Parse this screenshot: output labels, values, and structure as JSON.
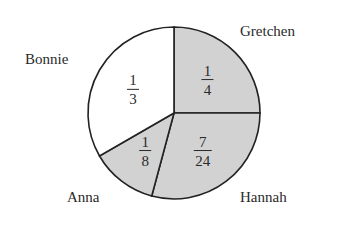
{
  "chart_data": {
    "type": "pie",
    "title": "",
    "slices": [
      {
        "label": "Gretchen",
        "fraction": "1/4",
        "num": "1",
        "den": "4",
        "value": 0.25,
        "fill": "#d2d2d2"
      },
      {
        "label": "Hannah",
        "fraction": "7/24",
        "num": "7",
        "den": "24",
        "value": 0.2917,
        "fill": "#d2d2d2"
      },
      {
        "label": "Anna",
        "fraction": "1/8",
        "num": "1",
        "den": "8",
        "value": 0.125,
        "fill": "#d2d2d2"
      },
      {
        "label": "Bonnie",
        "fraction": "1/3",
        "num": "1",
        "den": "3",
        "value": 0.3333,
        "fill": "#ffffff"
      }
    ],
    "start_angle_deg": 0,
    "direction": "clockwise from 12 o'clock",
    "legend": "none; labels placed outside slices"
  },
  "labels": {
    "gretchen": "Gretchen",
    "hannah": "Hannah",
    "anna": "Anna",
    "bonnie": "Bonnie"
  },
  "colors": {
    "shaded": "#d2d2d2",
    "unshaded": "#ffffff",
    "outline": "#222222"
  }
}
